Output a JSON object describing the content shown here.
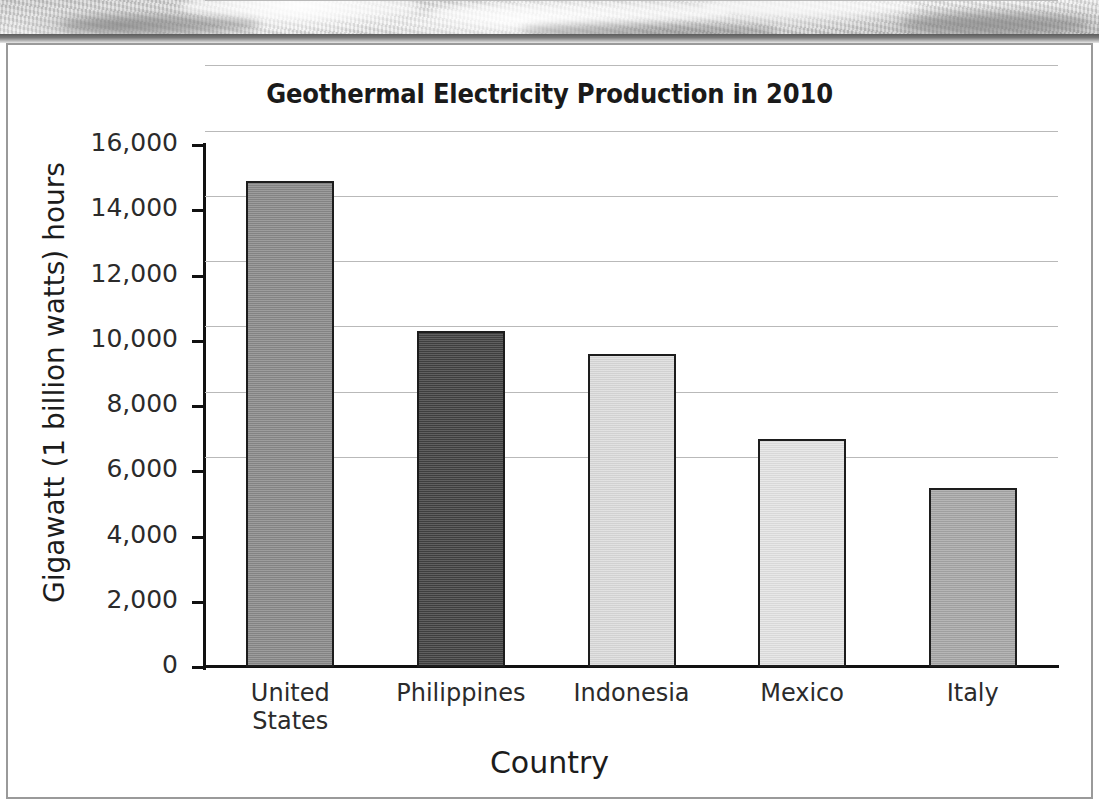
{
  "banner": {
    "name": "decorative-photo-strip"
  },
  "chart_data": {
    "type": "bar",
    "title": "Geothermal Electricity Production in 2010",
    "xlabel": "Country",
    "ylabel": "Gigawatt (1 billion watts) hours",
    "categories": [
      "United States",
      "Philippines",
      "Indonesia",
      "Mexico",
      "Italy"
    ],
    "category_lines": [
      [
        "United",
        "States"
      ],
      [
        "Philippines"
      ],
      [
        "Indonesia"
      ],
      [
        "Mexico"
      ],
      [
        "Italy"
      ]
    ],
    "values": [
      14900,
      10300,
      9600,
      7000,
      5500
    ],
    "bar_colors": [
      "#8a8a8a",
      "#414141",
      "#dcdcdc",
      "#e4e4e4",
      "#a8a8a8"
    ],
    "ylim": [
      0,
      16000
    ],
    "ytick_values": [
      16000,
      14000,
      12000,
      10000,
      8000,
      6000,
      4000,
      2000,
      0
    ],
    "ytick_labels": [
      "16,000",
      "14,000",
      "12,000",
      "10,000",
      "8,000",
      "6,000",
      "4,000",
      "2,000",
      "0"
    ],
    "grid": true,
    "grid_color": "#b9b9b9",
    "legend": null,
    "axis_color": "#111111"
  }
}
